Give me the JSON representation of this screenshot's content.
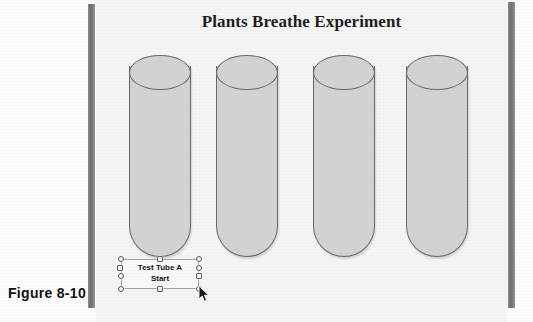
{
  "figure": {
    "caption": "Figure 8-10"
  },
  "slide": {
    "title": "Plants Breathe Experiment",
    "background_color": "#f4f4f4"
  },
  "tubes": {
    "fill_color": "#d2d2d2",
    "outline_color": "#6a6a6a",
    "items": [
      {
        "name": "Test Tube A",
        "left": 129,
        "top": 55
      },
      {
        "name": "Test Tube B",
        "left": 216,
        "top": 55
      },
      {
        "name": "Test Tube C",
        "left": 313,
        "top": 55
      },
      {
        "name": "Test Tube D",
        "left": 406,
        "top": 55
      }
    ]
  },
  "textbox": {
    "line1": "Test Tube A",
    "line2": "Start",
    "selected": true,
    "border_color": "#9aa4b0",
    "handle_fill": "#f2f2f2",
    "handle_border": "#5a5a5a",
    "handles": [
      {
        "name": "handle-top-left",
        "shape": "round",
        "x": -3,
        "y": -3
      },
      {
        "name": "handle-top-center",
        "shape": "sq",
        "x": 36,
        "y": -3
      },
      {
        "name": "handle-top-right",
        "shape": "round",
        "x": 75,
        "y": -3
      },
      {
        "name": "handle-middle-left",
        "shape": "sq",
        "x": -3,
        "y": 5
      },
      {
        "name": "handle-middle-left-2",
        "shape": "round",
        "x": -3,
        "y": 13
      },
      {
        "name": "handle-middle-right",
        "shape": "round",
        "x": 75,
        "y": 5
      },
      {
        "name": "handle-middle-right-2",
        "shape": "sq",
        "x": 75,
        "y": 13
      },
      {
        "name": "handle-bottom-left",
        "shape": "round",
        "x": -3,
        "y": 27
      },
      {
        "name": "handle-bottom-center",
        "shape": "sq",
        "x": 36,
        "y": 27
      },
      {
        "name": "handle-bottom-right",
        "shape": "round",
        "x": 75,
        "y": 27
      }
    ]
  },
  "cursor": {
    "type": "arrow-pointer",
    "x": 198,
    "y": 285
  },
  "page_edges": {
    "left_bar_color": "#6f6f6f",
    "right_bar_color": "#6f6f6f"
  }
}
